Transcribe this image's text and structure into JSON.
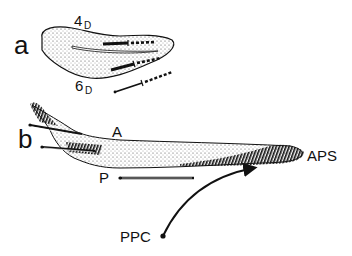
{
  "panels": {
    "a": {
      "label": "a",
      "digit_top": "4",
      "digit_top_sub": "D",
      "digit_bottom": "6",
      "digit_bottom_sub": "D"
    },
    "b": {
      "label": "b",
      "anterior": "A",
      "posterior": "P",
      "aps": "APS",
      "ppc": "PPC"
    }
  },
  "colors": {
    "ink": "#111111",
    "stipple": "#444444",
    "background": "#ffffff"
  }
}
